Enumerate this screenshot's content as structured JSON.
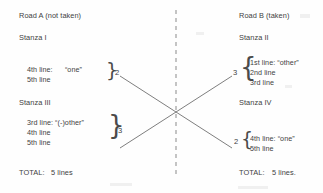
{
  "diagram": {
    "title_left": "Road A (not taken)",
    "title_right": "Road B (taken)",
    "divider": "dashed-vertical-line",
    "left": {
      "stanza_top_label": "Stanza I",
      "stanza_top_block": {
        "lines": [
          "4th line:      “one”",
          "5th line"
        ],
        "count": "2"
      },
      "stanza_bottom_label": "Stanza III",
      "stanza_bottom_block": {
        "lines": [
          "3rd line: “(-)other”",
          "4th line",
          "5th line"
        ],
        "count": "3"
      },
      "total_label": "TOTAL:",
      "total_value": "5 lines"
    },
    "right": {
      "stanza_top_label": "Stanza II",
      "stanza_top_block": {
        "lines": [
          "1st line: “other”",
          "2nd line",
          "3rd line"
        ],
        "count": "3"
      },
      "stanza_bottom_label": "Stanza IV",
      "stanza_bottom_block": {
        "lines": [
          "4th line: “one”",
          "5th line"
        ],
        "count": "2"
      },
      "total_label": "TOTAL:",
      "total_value": "5 lines."
    },
    "colors": {
      "ink": "#3f3f3f",
      "rule": "#7a7a7a",
      "background": "#fefefe"
    }
  }
}
